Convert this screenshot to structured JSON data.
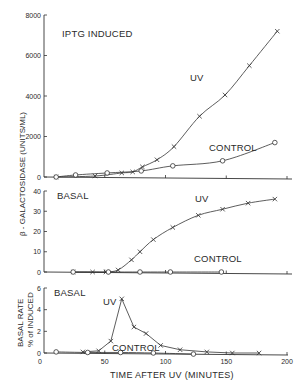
{
  "chart_data": [
    {
      "type": "line",
      "panel": "top",
      "title": "IPTG INDUCED",
      "xlabel": "TIME AFTER UV (MINUTES)",
      "ylabel": "β - GALACTOSIDASE (UNITS/ML)",
      "xlim": [
        0,
        200
      ],
      "ylim": [
        0,
        8000
      ],
      "yticks": [
        0,
        2000,
        4000,
        6000,
        8000
      ],
      "ytick_labels": [
        "0",
        "2000",
        "4000",
        "6000",
        "8000"
      ],
      "grid": false,
      "series": [
        {
          "name": "UV",
          "marker": "x",
          "x": [
            10,
            42,
            64,
            73,
            81,
            93,
            107,
            128,
            149,
            169,
            192
          ],
          "y": [
            0,
            50,
            200,
            250,
            500,
            850,
            1500,
            3000,
            4050,
            5500,
            7200
          ]
        },
        {
          "name": "CONTROL",
          "marker": "o",
          "x": [
            10,
            26,
            52,
            80,
            106,
            147,
            190
          ],
          "y": [
            0,
            100,
            200,
            300,
            550,
            800,
            1700
          ]
        }
      ],
      "annotations": [
        {
          "text": "UV",
          "x": 124,
          "y": 5300
        },
        {
          "text": "CONTROL",
          "x": 135,
          "y": 1900
        }
      ]
    },
    {
      "type": "line",
      "panel": "middle",
      "title": "BASAL",
      "xlabel": "TIME AFTER UV (MINUTES)",
      "ylabel": "β - GALACTOSIDASE (UNITS/ML)",
      "xlim": [
        0,
        200
      ],
      "ylim": [
        0,
        40
      ],
      "yticks": [
        0,
        10,
        20,
        30,
        40
      ],
      "ytick_labels": [
        "0",
        "10",
        "20",
        "30",
        "40"
      ],
      "grid": false,
      "series": [
        {
          "name": "UV",
          "marker": "x",
          "x": [
            24,
            40,
            51,
            61,
            72,
            79,
            90,
            106,
            127,
            147,
            168,
            190
          ],
          "y": [
            0,
            0,
            0,
            1,
            6,
            10,
            16,
            22,
            28,
            31,
            34,
            36
          ]
        },
        {
          "name": "CONTROL",
          "marker": "o",
          "x": [
            24,
            53,
            79,
            104,
            146
          ],
          "y": [
            0,
            0,
            0,
            0,
            0
          ]
        }
      ],
      "annotations": [
        {
          "text": "UV",
          "x": 127,
          "y": 36
        },
        {
          "text": "CONTROL",
          "x": 127,
          "y": 8
        }
      ]
    },
    {
      "type": "line",
      "panel": "bottom",
      "title": "BASAL",
      "xlabel": "TIME AFTER UV (MINUTES)",
      "ylabel": "BASAL RATE % of INDUCED",
      "xlim": [
        0,
        200
      ],
      "ylim": [
        0,
        6
      ],
      "xticks": [
        0,
        50,
        100,
        150,
        200
      ],
      "xtick_labels": [
        "0",
        "50",
        "100",
        "150",
        "200"
      ],
      "yticks": [
        0,
        2,
        4,
        6
      ],
      "ytick_labels": [
        "0",
        "2",
        "4",
        "6"
      ],
      "grid": false,
      "series": [
        {
          "name": "UV",
          "marker": "x",
          "x": [
            32,
            45,
            55,
            64,
            74,
            84,
            96,
            112,
            134,
            155,
            177
          ],
          "y": [
            0.1,
            0.2,
            1.1,
            5.0,
            2.4,
            1.8,
            0.7,
            0.3,
            0.1,
            0.0,
            0.0
          ]
        },
        {
          "name": "CONTROL",
          "marker": "o",
          "x": [
            10,
            36,
            63,
            90,
            123
          ],
          "y": [
            0.1,
            0.05,
            0.05,
            0.0,
            -0.1
          ]
        }
      ],
      "annotations": [
        {
          "text": "UV",
          "x": 53,
          "y": 4.5
        },
        {
          "text": "CONTROL",
          "x": 58,
          "y": 0.6
        }
      ]
    }
  ],
  "labels": {
    "top_title": "IPTG INDUCED",
    "mid_title": "BASAL",
    "bot_title": "BASAL",
    "uv": "UV",
    "control": "CONTROL",
    "ylabel_main": "β - GALACTOSIDASE (UNITS/ML)",
    "ylabel_bottom_1": "BASAL RATE",
    "ylabel_bottom_2": "% of INDUCED",
    "xlabel": "TIME AFTER UV (MINUTES)"
  }
}
